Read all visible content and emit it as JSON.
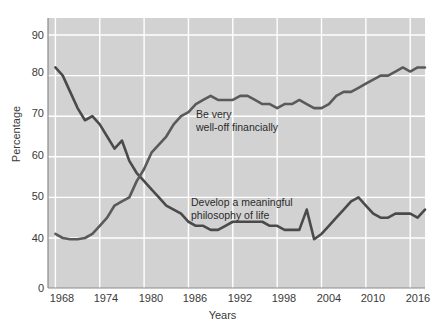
{
  "chart_data": {
    "type": "line",
    "title": "",
    "xlabel": "Years",
    "ylabel": "Percentage",
    "xlim": [
      1967,
      2018
    ],
    "ylim": [
      0,
      95
    ],
    "grid": true,
    "legend_position": "inline-annotations",
    "xticks": [
      "1968",
      "1974",
      "1980",
      "1986",
      "1992",
      "1998",
      "2004",
      "2010",
      "2016"
    ],
    "yticks": [
      "90",
      "80",
      "70",
      "60",
      "50",
      "40",
      "0"
    ],
    "x": [
      1968,
      1969,
      1970,
      1971,
      1972,
      1973,
      1974,
      1975,
      1976,
      1977,
      1978,
      1979,
      1980,
      1981,
      1982,
      1983,
      1984,
      1985,
      1986,
      1987,
      1988,
      1989,
      1990,
      1991,
      1992,
      1993,
      1994,
      1995,
      1996,
      1997,
      1998,
      1999,
      2000,
      2001,
      2002,
      2003,
      2004,
      2005,
      2006,
      2007,
      2008,
      2009,
      2010,
      2011,
      2012,
      2013,
      2014,
      2015,
      2016,
      2017,
      2018
    ],
    "series": [
      {
        "name": "Develop a meaningful philosophy of life",
        "annotation": "Develop a meaningful\nphilosophy of life",
        "color": "#4a4a4a",
        "values": [
          82,
          80,
          76,
          72,
          69,
          70,
          68,
          65,
          62,
          64,
          59,
          56,
          54,
          52,
          50,
          48,
          47,
          46,
          44,
          43,
          43,
          42,
          42,
          43,
          44,
          44,
          44,
          44,
          44,
          43,
          43,
          42,
          42,
          42,
          47,
          39,
          41,
          43,
          45,
          47,
          49,
          50,
          48,
          46,
          45,
          45,
          46,
          46,
          46,
          45,
          47
        ]
      },
      {
        "name": "Be very well-off financially",
        "annotation": "Be very\nwell-off financially",
        "color": "#5a5a5a",
        "values": [
          41,
          40,
          39,
          39,
          40,
          41,
          43,
          45,
          48,
          49,
          50,
          54,
          57,
          61,
          63,
          65,
          68,
          70,
          71,
          73,
          74,
          75,
          74,
          74,
          74,
          75,
          75,
          74,
          73,
          73,
          72,
          73,
          73,
          74,
          73,
          72,
          72,
          73,
          75,
          76,
          76,
          77,
          78,
          79,
          80,
          80,
          81,
          82,
          81,
          82,
          82
        ]
      }
    ]
  }
}
